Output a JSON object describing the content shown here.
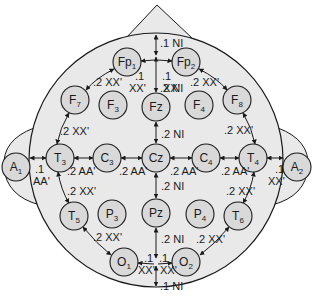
{
  "diagram": {
    "type": "eeg-10-20-electrode-placement",
    "colors": {
      "head_fill": "#e9e9e9",
      "electrode_fill": "#d9d9d9",
      "stroke": "#1a1a1a",
      "background": "#ffffff"
    },
    "electrodes": [
      {
        "id": "Fp1",
        "base": "Fp",
        "sub": "1",
        "x": 127,
        "y": 62
      },
      {
        "id": "Fp2",
        "base": "Fp",
        "sub": "2",
        "x": 186,
        "y": 62
      },
      {
        "id": "F7",
        "base": "F",
        "sub": "7",
        "x": 75,
        "y": 100
      },
      {
        "id": "F3",
        "base": "F",
        "sub": "3",
        "x": 113,
        "y": 105
      },
      {
        "id": "Fz",
        "base": "Fz",
        "sub": "",
        "x": 156,
        "y": 107
      },
      {
        "id": "F4",
        "base": "F",
        "sub": "4",
        "x": 199,
        "y": 105
      },
      {
        "id": "F8",
        "base": "F",
        "sub": "8",
        "x": 237,
        "y": 100
      },
      {
        "id": "A1",
        "base": "A",
        "sub": "1",
        "x": 16,
        "y": 167
      },
      {
        "id": "T3",
        "base": "T",
        "sub": "3",
        "x": 60,
        "y": 158
      },
      {
        "id": "C3",
        "base": "C",
        "sub": "3",
        "x": 107,
        "y": 158
      },
      {
        "id": "Cz",
        "base": "Cz",
        "sub": "",
        "x": 156,
        "y": 158
      },
      {
        "id": "C4",
        "base": "C",
        "sub": "4",
        "x": 206,
        "y": 158
      },
      {
        "id": "T4",
        "base": "T",
        "sub": "4",
        "x": 253,
        "y": 158
      },
      {
        "id": "A2",
        "base": "A",
        "sub": "2",
        "x": 297,
        "y": 167
      },
      {
        "id": "T5",
        "base": "T",
        "sub": "5",
        "x": 74,
        "y": 216
      },
      {
        "id": "P3",
        "base": "P",
        "sub": "3",
        "x": 112,
        "y": 214
      },
      {
        "id": "Pz",
        "base": "Pz",
        "sub": "",
        "x": 156,
        "y": 213
      },
      {
        "id": "P4",
        "base": "P",
        "sub": "4",
        "x": 200,
        "y": 214
      },
      {
        "id": "T6",
        "base": "T",
        "sub": "6",
        "x": 238,
        "y": 216
      },
      {
        "id": "O1",
        "base": "O",
        "sub": "1",
        "x": 124,
        "y": 262
      },
      {
        "id": "O2",
        "base": "O",
        "sub": "2",
        "x": 186,
        "y": 262
      }
    ],
    "labels": [
      {
        "text": ".1 NI",
        "x": 160,
        "y": 47
      },
      {
        "text": ".1",
        "x": 135,
        "y": 80
      },
      {
        "text": "XX'",
        "x": 129,
        "y": 92
      },
      {
        "text": ".1",
        "x": 162,
        "y": 80
      },
      {
        "text": "XX'",
        "x": 163,
        "y": 92
      },
      {
        "text": ".2 NI",
        "x": 160,
        "y": 92
      },
      {
        "text": ".2 XX'",
        "x": 93,
        "y": 86
      },
      {
        "text": ".2 XX'",
        "x": 190,
        "y": 86
      },
      {
        "text": ".2 XX'",
        "x": 60,
        "y": 135
      },
      {
        "text": ".2 XX'",
        "x": 224,
        "y": 134
      },
      {
        "text": ".2 NI",
        "x": 161,
        "y": 138
      },
      {
        "text": ".1",
        "x": 35,
        "y": 173
      },
      {
        "text": "AA'",
        "x": 33,
        "y": 185
      },
      {
        "text": ".2 AA'",
        "x": 67,
        "y": 175
      },
      {
        "text": ".2 AA'",
        "x": 119,
        "y": 175
      },
      {
        "text": ".2 AA'",
        "x": 170,
        "y": 175
      },
      {
        "text": ".2 AA'",
        "x": 221,
        "y": 175
      },
      {
        "text": ".1",
        "x": 275,
        "y": 173
      },
      {
        "text": "XX'",
        "x": 268,
        "y": 185
      },
      {
        "text": ".2 XX'",
        "x": 67,
        "y": 195
      },
      {
        "text": ".2 NI",
        "x": 161,
        "y": 190
      },
      {
        "text": ".2 XX'",
        "x": 226,
        "y": 195
      },
      {
        "text": ".2 XX'",
        "x": 93,
        "y": 241
      },
      {
        "text": ".2 NI",
        "x": 161,
        "y": 243
      },
      {
        "text": ".2 XX'",
        "x": 196,
        "y": 243
      },
      {
        "text": ".1",
        "x": 144,
        "y": 262
      },
      {
        "text": ".1",
        "x": 159,
        "y": 262
      },
      {
        "text": "XX'",
        "x": 138,
        "y": 274
      },
      {
        "text": "XX'",
        "x": 160,
        "y": 274
      },
      {
        "text": ".1 NI",
        "x": 160,
        "y": 290
      }
    ]
  }
}
